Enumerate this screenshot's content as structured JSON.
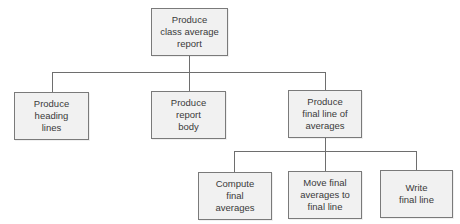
{
  "diagram": {
    "type": "hierarchy-chart",
    "colors": {
      "box_fill": "#f1f1f1",
      "box_border": "#7a7a7a",
      "connector": "#6e6e6e",
      "text": "#3a3a3a"
    },
    "root": {
      "id": "produce-class-average-report",
      "lines": [
        "Produce",
        "class average",
        "report"
      ]
    },
    "level1": [
      {
        "id": "produce-heading-lines",
        "lines": [
          "Produce",
          "heading",
          "lines"
        ]
      },
      {
        "id": "produce-report-body",
        "lines": [
          "Produce",
          "report",
          "body"
        ]
      },
      {
        "id": "produce-final-line-of-averages",
        "lines": [
          "Produce",
          "final line of",
          "averages"
        ]
      }
    ],
    "level2": [
      {
        "id": "compute-final-averages",
        "parent": "produce-final-line-of-averages",
        "lines": [
          "Compute",
          "final",
          "averages"
        ]
      },
      {
        "id": "move-final-averages-to-final-line",
        "parent": "produce-final-line-of-averages",
        "lines": [
          "Move final",
          "averages to",
          "final line"
        ]
      },
      {
        "id": "write-final-line",
        "parent": "produce-final-line-of-averages",
        "lines": [
          "Write",
          "final line"
        ]
      }
    ]
  }
}
